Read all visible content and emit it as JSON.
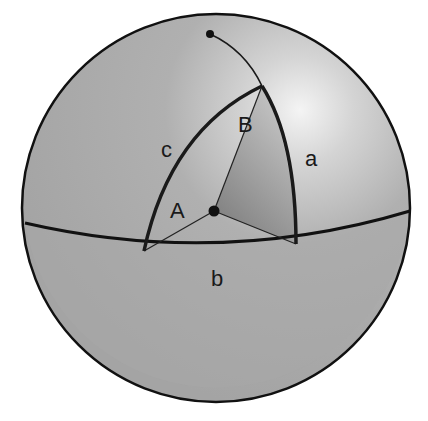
{
  "diagram": {
    "type": "spherical-triangle",
    "colors": {
      "sphere_base": "#a9a9a9",
      "highlight": "#f2f2f2",
      "outline": "#111111",
      "wedge_shade": "#8c8c8c"
    },
    "labels": {
      "side_a": "a",
      "side_b": "b",
      "side_c": "c",
      "angle_A": "A",
      "angle_B": "B"
    }
  }
}
